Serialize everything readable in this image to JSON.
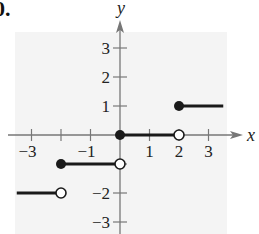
{
  "problem_label": "0.",
  "chart_data": {
    "type": "line",
    "title": "",
    "xlabel": "x",
    "ylabel": "y",
    "xlim": [
      -3.5,
      3.8
    ],
    "ylim": [
      -3.4,
      3.8
    ],
    "grid": false,
    "x_ticks": [
      -3,
      -2,
      -1,
      1,
      2,
      3
    ],
    "x_tick_labels": [
      "-3",
      "-1",
      "1",
      "2",
      "3"
    ],
    "y_ticks": [
      -3,
      -2,
      -1,
      1,
      2,
      3
    ],
    "y_tick_labels": [
      "3",
      "2",
      "1",
      "-2",
      "-3"
    ],
    "series": [
      {
        "name": "step segment 1",
        "x": [
          -3.5,
          -2
        ],
        "y": [
          -2,
          -2
        ],
        "left_endpoint": "none",
        "right_endpoint": "open"
      },
      {
        "name": "step segment 2",
        "x": [
          -2,
          0
        ],
        "y": [
          -1,
          -1
        ],
        "left_endpoint": "closed",
        "right_endpoint": "open"
      },
      {
        "name": "step segment 3",
        "x": [
          0,
          2
        ],
        "y": [
          0,
          0
        ],
        "left_endpoint": "closed",
        "right_endpoint": "open"
      },
      {
        "name": "step segment 4",
        "x": [
          2,
          3.5
        ],
        "y": [
          1,
          1
        ],
        "left_endpoint": "closed",
        "right_endpoint": "none"
      }
    ],
    "style": {
      "line_color": "#1a1a1a",
      "axis_color": "#777777",
      "background_panel": "#f4f4f4"
    }
  }
}
